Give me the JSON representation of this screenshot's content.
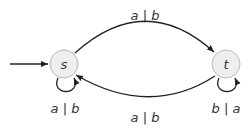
{
  "diagram": {
    "type": "finite-state-transducer",
    "colors": {
      "node_fill": "#eeeeee",
      "node_stroke": "#bbbbbb",
      "edge": "#222222",
      "text": "#333333"
    },
    "nodes": [
      {
        "id": "s",
        "label": "s",
        "initial": true
      },
      {
        "id": "t",
        "label": "t",
        "initial": false
      }
    ],
    "edges": [
      {
        "from": "s",
        "to": "t",
        "label": "a | b"
      },
      {
        "from": "t",
        "to": "s",
        "label": "a | b"
      },
      {
        "from": "s",
        "to": "s",
        "label": "a | b"
      },
      {
        "from": "t",
        "to": "t",
        "label": "b | a"
      }
    ]
  }
}
